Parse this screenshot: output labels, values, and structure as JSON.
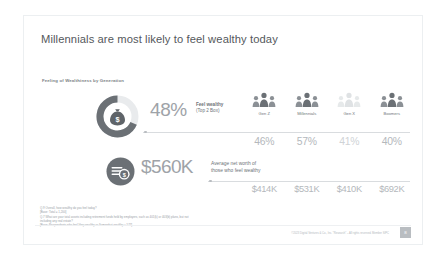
{
  "slide": {
    "title": "Millennials are most likely to feel wealthy today",
    "subtitle": "Feeling of Wealthiness by Generation",
    "page_number": "8",
    "copyright": "©2023 Digital Ventures & Co., Inc. \"Research\" – All rights reserved. Member SIPC"
  },
  "metrics": [
    {
      "icon": "money-bag-icon",
      "value": "48%",
      "label_top": "Feel wealthy",
      "label_bottom": "(Top 2 Box)"
    },
    {
      "icon": "coins-circle-icon",
      "value": "$560K",
      "label_top": "Average net worth of",
      "label_bottom": "those who feel wealthy"
    }
  ],
  "generations": [
    {
      "label": "Gen Z",
      "feel_wealthy_pct": "46%",
      "net_worth": "$414K",
      "dim": false
    },
    {
      "label": "Millennials",
      "feel_wealthy_pct": "57%",
      "net_worth": "$531K",
      "dim": false
    },
    {
      "label": "Gen X",
      "feel_wealthy_pct": "41%",
      "net_worth": "$410K",
      "dim": true
    },
    {
      "label": "Boomers",
      "feel_wealthy_pct": "40%",
      "net_worth": "$692K",
      "dim": false
    }
  ],
  "footnotes": [
    "Q.9  Overall, how wealthy do you feel today?",
    "[Base: Total = 1,200]",
    "Q.7  What are your total assets including retirement funds held by employers, such as 401(k) or 403(b) plans, but not",
    "including any real estate?",
    "[Base: Respondents who feel Very wealthy or Somewhat wealthy = 577]"
  ],
  "chart_data": {
    "type": "bar",
    "title": "Feeling of Wealthiness by Generation",
    "categories": [
      "Gen Z",
      "Millennials",
      "Gen X",
      "Boomers"
    ],
    "series": [
      {
        "name": "Feel wealthy (Top 2 Box), %",
        "values": [
          46,
          57,
          41,
          40
        ],
        "overall": 48
      },
      {
        "name": "Average net worth of those who feel wealthy, $K",
        "values": [
          414,
          531,
          410,
          692
        ],
        "overall": 560
      }
    ],
    "xlabel": "",
    "ylabel": "",
    "grid": false,
    "legend": "none"
  },
  "colors": {
    "title": "#54585c",
    "big_value": "#9ea3a8",
    "stat": "#b4b8bc",
    "rule": "#d9dcdf",
    "icon_dark": "#6b7075"
  }
}
